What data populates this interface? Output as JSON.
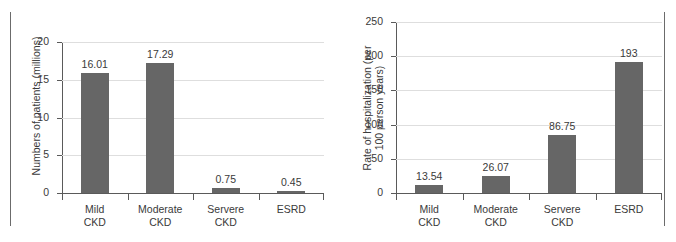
{
  "figure": {
    "panels": [
      "left",
      "right"
    ],
    "background": "#ffffff",
    "bar_color": "#666666",
    "grid_color": "#dedede",
    "axis_color": "#5a5a5a",
    "frame_color": "#6b6b6b"
  },
  "chart_data": [
    {
      "type": "bar",
      "title": "",
      "xlabel": "",
      "ylabel": "Numbers of patients (millions)",
      "categories": [
        "Mild\nCKD",
        "Moderate\nCKD",
        "Servere\nCKD",
        "ESRD"
      ],
      "values": [
        16.01,
        17.29,
        0.75,
        0.45
      ],
      "value_labels": [
        "16.01",
        "17.29",
        "0.75",
        "0.45"
      ],
      "ylim": [
        0,
        20
      ],
      "yticks": [
        0,
        5,
        10,
        15,
        20
      ],
      "ytick_labels": [
        "0",
        "5",
        "10",
        "15",
        "20"
      ],
      "grid": true,
      "legend": "none"
    },
    {
      "type": "bar",
      "title": "",
      "xlabel": "",
      "ylabel": "Rate of hospitalization (per\n100 person years)",
      "categories": [
        "Mild\nCKD",
        "Moderate\nCKD",
        "Servere\nCKD",
        "ESRD"
      ],
      "values": [
        13.54,
        26.07,
        86.75,
        193
      ],
      "value_labels": [
        "13.54",
        "26.07",
        "86.75",
        "193"
      ],
      "ylim": [
        0,
        250
      ],
      "yticks": [
        0,
        50,
        100,
        150,
        200,
        250
      ],
      "ytick_labels": [
        "0",
        "50",
        "100",
        "150",
        "200",
        "250"
      ],
      "grid": true,
      "legend": "none"
    }
  ]
}
